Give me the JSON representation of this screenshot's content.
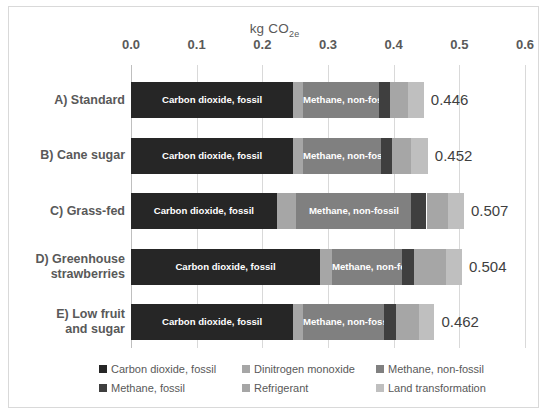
{
  "chart_data": {
    "type": "bar",
    "orientation": "horizontal",
    "stacked": true,
    "title": "kg CO2e",
    "title_rich": {
      "prefix": "kg CO",
      "sub": "2e"
    },
    "xlabel": "kg CO2e",
    "ylabel": "",
    "xlim": [
      0.0,
      0.6
    ],
    "xticks": [
      0.0,
      0.1,
      0.2,
      0.3,
      0.4,
      0.5,
      0.6
    ],
    "xtick_labels": [
      "0.0",
      "0.1",
      "0.2",
      "0.3",
      "0.4",
      "0.5",
      "0.6"
    ],
    "grid": true,
    "grid_axis": "x",
    "legend_position": "bottom",
    "categories": [
      "A) Standard",
      "B) Cane sugar",
      "C) Grass-fed",
      "D) Greenhouse strawberries",
      "E) Low fruit and sugar"
    ],
    "category_lines": [
      [
        "A) Standard"
      ],
      [
        "B) Cane sugar"
      ],
      [
        "C) Grass-fed"
      ],
      [
        "D) Greenhouse",
        "strawberries"
      ],
      [
        "E) Low fruit",
        "and sugar"
      ]
    ],
    "series": [
      {
        "name": "Carbon dioxide, fossil",
        "color": "#262626",
        "values": [
          0.247,
          0.247,
          0.222,
          0.288,
          0.247
        ]
      },
      {
        "name": "Dinitrogen monoxide",
        "color": "#a6a6a6",
        "values": [
          0.015,
          0.015,
          0.03,
          0.018,
          0.015
        ]
      },
      {
        "name": "Methane, non-fossil",
        "color": "#808080",
        "values": [
          0.115,
          0.118,
          0.175,
          0.107,
          0.124
        ]
      },
      {
        "name": "Methane, fossil",
        "color": "#3f3f3f",
        "values": [
          0.018,
          0.018,
          0.023,
          0.018,
          0.018
        ]
      },
      {
        "name": "Refrigerant",
        "color": "#a6a6a6",
        "values": [
          0.027,
          0.029,
          0.032,
          0.049,
          0.034
        ]
      },
      {
        "name": "Land transformation",
        "color": "#bfbfbf",
        "values": [
          0.024,
          0.025,
          0.025,
          0.024,
          0.024
        ]
      }
    ],
    "totals": [
      0.446,
      0.452,
      0.507,
      0.504,
      0.462
    ],
    "total_labels": [
      "0.446",
      "0.452",
      "0.507",
      "0.504",
      "0.462"
    ],
    "inline_segment_labels": [
      "Carbon dioxide, fossil",
      "Methane, non-fossil"
    ],
    "legend": [
      {
        "label": "Carbon dioxide, fossil",
        "color": "#262626"
      },
      {
        "label": "Dinitrogen monoxide",
        "color": "#a6a6a6"
      },
      {
        "label": "Methane, non-fossil",
        "color": "#808080"
      },
      {
        "label": "Methane, fossil",
        "color": "#3f3f3f"
      },
      {
        "label": "Refrigerant",
        "color": "#a6a6a6"
      },
      {
        "label": "Land transformation",
        "color": "#bfbfbf"
      }
    ],
    "colors": {
      "plot_background": "#ffffff",
      "frame_border": "#d9d9d9",
      "gridline": "#d9d9d9",
      "text": "#595959",
      "value_text": "#3f3f3f"
    }
  }
}
